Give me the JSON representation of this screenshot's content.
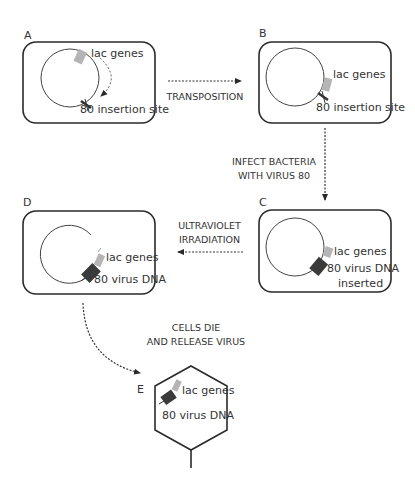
{
  "colors": {
    "outline": "#2a2a2a",
    "lac_gene": "#b5b5b5",
    "virus_dna": "#3a3a3a",
    "background": "#ffffff"
  },
  "panels": {
    "A": {
      "letter": "A",
      "label_top": "lac genes",
      "label_bottom": "80 insertion site"
    },
    "B": {
      "letter": "B",
      "label_top": "lac genes",
      "label_bottom": "80 insertion site"
    },
    "C": {
      "letter": "C",
      "label_top": "lac genes",
      "label_bottom": "80 virus DNA",
      "label_bottom2": "inserted"
    },
    "D": {
      "letter": "D",
      "label_top": "lac genes",
      "label_bottom": "80 virus DNA"
    },
    "E": {
      "letter": "E",
      "label_top": "lac genes",
      "label_bottom": "80 virus DNA"
    }
  },
  "steps": {
    "a_to_b": "TRANSPOSITION",
    "b_to_c_line1": "INFECT BACTERIA",
    "b_to_c_line2": "WITH VIRUS 80",
    "c_to_d_line1": "ULTRAVIOLET",
    "c_to_d_line2": "IRRADIATION",
    "d_to_e_line1": "CELLS DIE",
    "d_to_e_line2": "AND RELEASE VIRUS"
  }
}
